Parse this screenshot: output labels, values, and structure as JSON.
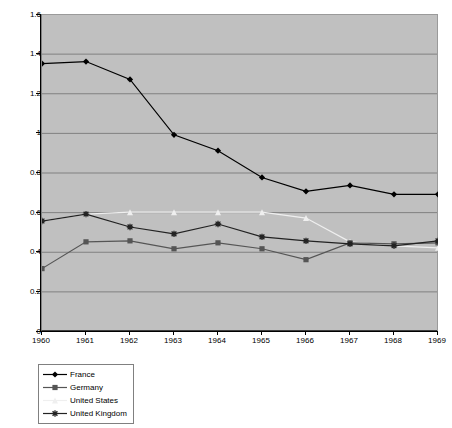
{
  "chart_data": {
    "type": "line",
    "title": "",
    "subtitle": "",
    "xlabel": "",
    "ylabel": "",
    "categories": [
      "1960",
      "1961",
      "1962",
      "1963",
      "1964",
      "1965",
      "1966",
      "1967",
      "1968",
      "1969"
    ],
    "x": [
      1960,
      1961,
      1962,
      1963,
      1964,
      1965,
      1966,
      1967,
      1968,
      1969
    ],
    "ylim": [
      0,
      1.6
    ],
    "xlim": [
      1960,
      1969
    ],
    "ytick_labels": [
      "0",
      "0.2",
      "0.4",
      "0.6",
      "0.8",
      "1",
      "1.2",
      "1.4",
      "1.6"
    ],
    "ytick_values": [
      0,
      0.2,
      0.4,
      0.6,
      0.8,
      1,
      1.2,
      1.4,
      1.6
    ],
    "xtick_labels": [
      "1960",
      "1961",
      "1962",
      "1963",
      "1964",
      "1965",
      "1966",
      "1967",
      "1968",
      "1969"
    ],
    "grid": "horizontal",
    "plot_background": "#c0c0c0",
    "legend_position": "bottom-left",
    "series": [
      {
        "name": "France",
        "color": "#000000",
        "marker": "diamond",
        "values": [
          1.35,
          1.36,
          1.27,
          0.99,
          0.91,
          0.775,
          0.705,
          0.735,
          0.69,
          0.69
        ]
      },
      {
        "name": "Germany",
        "color": "#555555",
        "marker": "square",
        "values": [
          0.315,
          0.45,
          0.455,
          0.415,
          0.445,
          0.415,
          0.36,
          0.445,
          0.44,
          0.445
        ]
      },
      {
        "name": "United States",
        "color": "#efefef",
        "marker": "triangle",
        "values": [
          0.555,
          0.59,
          0.6,
          0.6,
          0.6,
          0.6,
          0.57,
          0.45,
          0.43,
          0.42
        ]
      },
      {
        "name": "United Kingdom",
        "color": "#222222",
        "marker": "cross",
        "values": [
          0.555,
          0.59,
          0.525,
          0.49,
          0.54,
          0.475,
          0.455,
          0.44,
          0.43,
          0.455
        ]
      }
    ]
  },
  "legend": {
    "items": [
      {
        "label": "France"
      },
      {
        "label": "Germany"
      },
      {
        "label": "United States"
      },
      {
        "label": "United Kingdom"
      }
    ]
  }
}
